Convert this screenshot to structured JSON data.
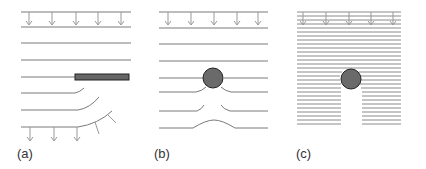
{
  "figure": {
    "panels": [
      {
        "id": "a",
        "label": "(a)",
        "obstacle": "plate"
      },
      {
        "id": "b",
        "label": "(b)",
        "obstacle": "cylinder"
      },
      {
        "id": "c",
        "label": "(c)",
        "obstacle": "cylinder-dense"
      }
    ],
    "colors": {
      "line": "#6e6e6e",
      "obstacle": "#6a6a6a",
      "obstacle_stroke": "#222222"
    }
  }
}
